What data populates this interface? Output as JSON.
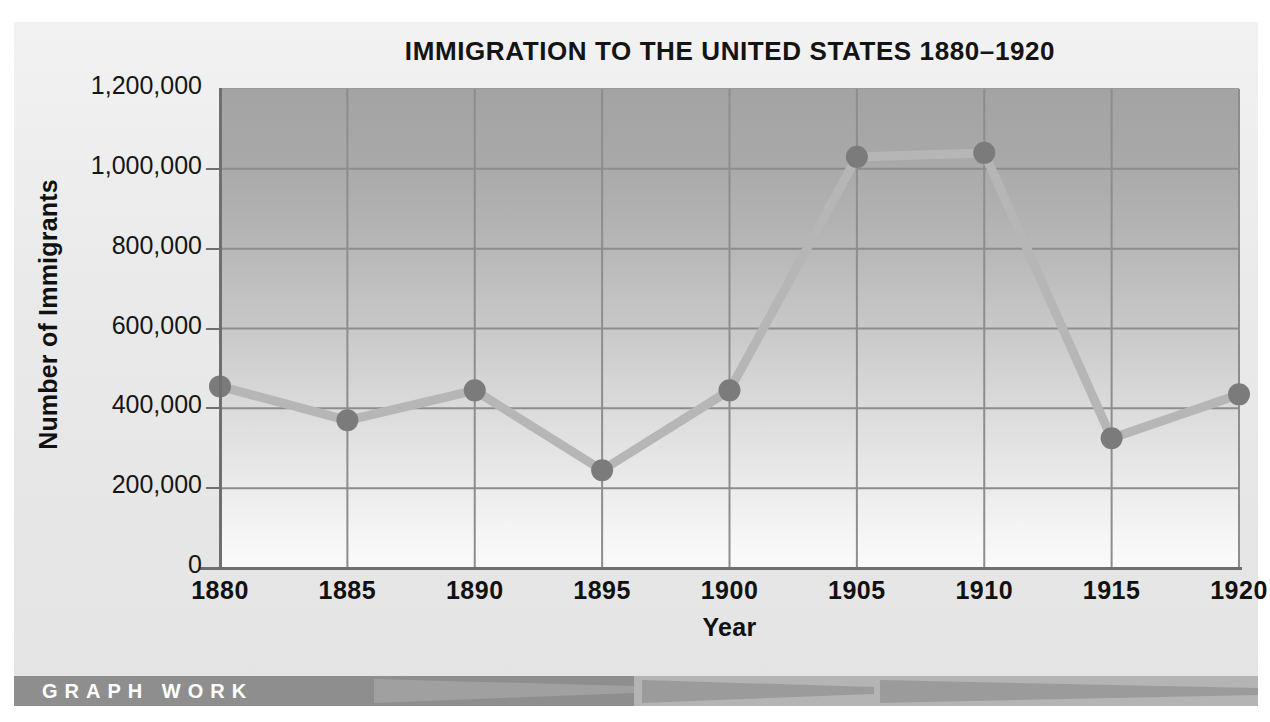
{
  "chart_data": {
    "type": "line",
    "title": "IMMIGRATION TO THE UNITED STATES 1880–1920",
    "xlabel": "Year",
    "ylabel": "Number of Immigrants",
    "categories": [
      "1880",
      "1885",
      "1890",
      "1895",
      "1900",
      "1905",
      "1910",
      "1915",
      "1920"
    ],
    "values": [
      455000,
      370000,
      445000,
      245000,
      445000,
      1030000,
      1040000,
      325000,
      435000
    ],
    "x": [
      1880,
      1885,
      1890,
      1895,
      1900,
      1905,
      1910,
      1915,
      1920
    ],
    "ylim": [
      0,
      1200000
    ],
    "xlim": [
      1880,
      1920
    ],
    "y_ticks": [
      0,
      200000,
      400000,
      600000,
      800000,
      1000000,
      1200000
    ],
    "y_tick_labels": [
      "0",
      "200,000",
      "400,000",
      "600,000",
      "800,000",
      "1,000,000",
      "1,200,000"
    ],
    "x_ticks": [
      1880,
      1885,
      1890,
      1895,
      1900,
      1905,
      1910,
      1915,
      1920
    ],
    "x_tick_labels": [
      "1880",
      "1885",
      "1890",
      "1895",
      "1900",
      "1905",
      "1910",
      "1915",
      "1920"
    ],
    "grid": true,
    "legend": null,
    "series": [
      {
        "name": "Number of Immigrants",
        "values": [
          455000,
          370000,
          445000,
          245000,
          445000,
          1030000,
          1040000,
          325000,
          435000
        ]
      }
    ],
    "marker": "circle",
    "colors": {
      "line": "#b6b6b6",
      "marker": "#7b7b7b",
      "grid": "#8d8d8d",
      "axis": "#6f6f6f",
      "text": "#111111",
      "plot_bg_top": "#a3a3a3",
      "plot_bg_bottom": "#fafafa",
      "page_bg": "#ebebeb",
      "footer_bar": "#8e8e8e",
      "footer_text": "#ffffff"
    }
  },
  "footer": {
    "label": "GRAPH WORK"
  }
}
